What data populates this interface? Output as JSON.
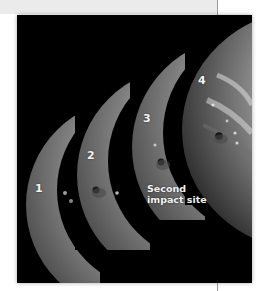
{
  "figure": {
    "panels": [
      {
        "number": "1"
      },
      {
        "number": "2"
      },
      {
        "number": "3"
      },
      {
        "number": "4"
      }
    ],
    "annotation": {
      "line1": "Second",
      "line2": "impact site"
    }
  },
  "colors": {
    "page_background": "#ffffff",
    "top_band": "#ebebeb",
    "divider": "#9a9a9a",
    "photo_background": "#000000",
    "label_text": "#f4f4f4"
  }
}
